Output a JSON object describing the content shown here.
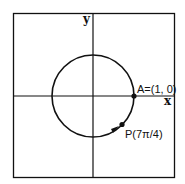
{
  "diagram": {
    "type": "unit-circle",
    "axes": {
      "x_label": "x",
      "y_label": "y"
    },
    "points": [
      {
        "id": "A",
        "label": "A=(1, 0)"
      },
      {
        "id": "P",
        "label": "P(7π/4)"
      }
    ],
    "colors": {
      "stroke": "#111111",
      "background": "#ffffff"
    }
  }
}
